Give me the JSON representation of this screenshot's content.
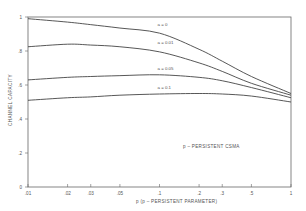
{
  "chart_data": {
    "type": "line",
    "title": "",
    "annotation": "p – PERSISTENT CSMA",
    "xlabel": "p   (p – PERSISTENT PARAMETER)",
    "ylabel": "CHANNEL CAPACITY",
    "xscale": "log",
    "xlim": [
      0.01,
      1
    ],
    "ylim": [
      0,
      1
    ],
    "grid": false,
    "legend_position": "inline labels near curves",
    "x_ticks": [
      0.01,
      0.02,
      0.03,
      0.05,
      0.1,
      0.2,
      0.3,
      0.5,
      1
    ],
    "x_tick_labels": [
      ".01",
      ".02",
      ".03",
      ".05",
      ".1",
      ".2",
      ".3",
      ".5",
      "1"
    ],
    "y_ticks": [
      0,
      0.2,
      0.4,
      0.6,
      0.8,
      1
    ],
    "y_tick_labels": [
      "0",
      ".2",
      ".4",
      ".6",
      ".8",
      "1"
    ],
    "x": [
      0.01,
      0.02,
      0.03,
      0.05,
      0.1,
      0.2,
      0.3,
      0.5,
      1
    ],
    "series": [
      {
        "name": "a = 0",
        "label": "a = 0",
        "values": [
          0.99,
          0.97,
          0.955,
          0.935,
          0.905,
          0.81,
          0.74,
          0.65,
          0.55
        ]
      },
      {
        "name": "a = 0.01",
        "label": "a = 0.01",
        "values": [
          0.825,
          0.84,
          0.835,
          0.825,
          0.795,
          0.73,
          0.68,
          0.61,
          0.54
        ]
      },
      {
        "name": "a = 0.05",
        "label": "a = 0.05",
        "values": [
          0.63,
          0.645,
          0.65,
          0.655,
          0.66,
          0.645,
          0.625,
          0.585,
          0.525
        ]
      },
      {
        "name": "a = 0.1",
        "label": "a = 0.1",
        "values": [
          0.51,
          0.525,
          0.53,
          0.54,
          0.547,
          0.55,
          0.547,
          0.535,
          0.5
        ]
      }
    ],
    "label_positions": [
      {
        "x": 0.1,
        "y": 0.945
      },
      {
        "x": 0.1,
        "y": 0.84
      },
      {
        "x": 0.1,
        "y": 0.69
      },
      {
        "x": 0.1,
        "y": 0.575
      }
    ]
  },
  "style": {
    "axis_color": "#666666",
    "line_color": "#444444",
    "text_color": "#555555"
  }
}
